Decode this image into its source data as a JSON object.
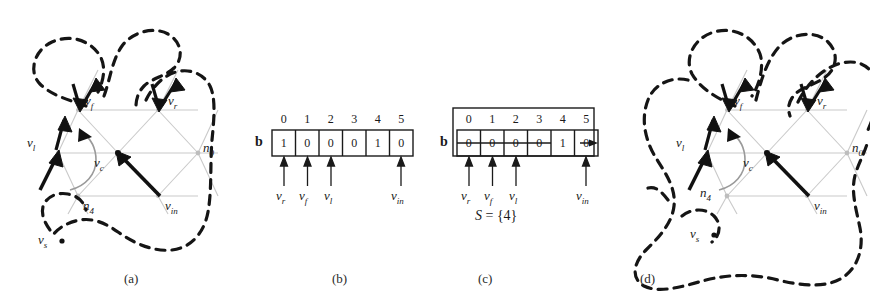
{
  "figure": {
    "panels": [
      {
        "id": "a",
        "label": "(a)",
        "type": "mesh"
      },
      {
        "id": "b",
        "label": "(b)",
        "type": "bitarray"
      },
      {
        "id": "c",
        "label": "(c)",
        "type": "bitarray"
      },
      {
        "id": "d",
        "label": "(d)",
        "type": "mesh"
      }
    ]
  },
  "mesh_a": {
    "vertex_labels": {
      "vf": "v",
      "vf_sub": "f",
      "vr": "v",
      "vr_sub": "r",
      "vl": "v",
      "vl_sub": "l",
      "vc": "v",
      "vc_sub": "c",
      "vin": "v",
      "vin_sub": "in",
      "vs": "v",
      "vs_sub": "s",
      "n0": "n",
      "n0_sub": "0",
      "n4": "n",
      "n4_sub": "4"
    }
  },
  "mesh_d": {
    "vertex_labels": {
      "vf": "v",
      "vf_sub": "f",
      "vr": "v",
      "vr_sub": "r",
      "vl": "v",
      "vl_sub": "l",
      "vc": "v",
      "vc_sub": "c",
      "vin": "v",
      "vin_sub": "in",
      "vs": "v",
      "vs_sub": "s",
      "n0": "n",
      "n0_sub": "0",
      "n4": "n",
      "n4_sub": "4"
    }
  },
  "array_b": {
    "name": "b",
    "indices": [
      "0",
      "1",
      "2",
      "3",
      "4",
      "5"
    ],
    "values": [
      "1",
      "0",
      "0",
      "0",
      "1",
      "0"
    ],
    "pointers": [
      {
        "index": 1,
        "label": "v",
        "sub": "r"
      },
      {
        "index": 2,
        "label": "v",
        "sub": "f"
      },
      {
        "index": 3,
        "label": "v",
        "sub": "l"
      },
      {
        "index": 5,
        "label": "v",
        "sub": "in"
      }
    ],
    "struck": []
  },
  "array_c": {
    "name": "b",
    "indices": [
      "0",
      "1",
      "2",
      "3",
      "4",
      "5"
    ],
    "values": [
      "0",
      "0",
      "0",
      "0",
      "1",
      "0"
    ],
    "pointers": [
      {
        "index": 1,
        "label": "v",
        "sub": "r"
      },
      {
        "index": 2,
        "label": "v",
        "sub": "f"
      },
      {
        "index": 3,
        "label": "v",
        "sub": "l"
      },
      {
        "index": 5,
        "label": "v",
        "sub": "in"
      }
    ],
    "struck": [
      0,
      1,
      2,
      3,
      5
    ],
    "set_text_S": "S",
    "set_text_eq": " = {4}"
  },
  "colors": {
    "mesh_line": "#c8c8c8",
    "dashed_curve": "#1a1a1a",
    "arrow": "#111111",
    "text": "#1a1a1a"
  }
}
